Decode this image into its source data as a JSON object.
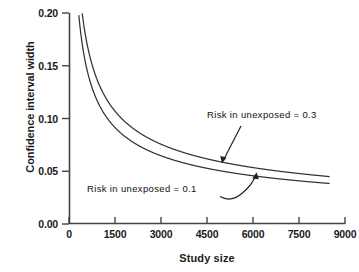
{
  "chart_data": {
    "type": "line",
    "title": "",
    "xlabel": "Study size",
    "ylabel": "Confidence interval width",
    "xlim": [
      0,
      9000
    ],
    "ylim": [
      0.0,
      0.2
    ],
    "xticks": [
      "0",
      "1500",
      "3000",
      "4500",
      "6000",
      "7500",
      "9000"
    ],
    "xtick_values": [
      0,
      1500,
      3000,
      4500,
      6000,
      7500,
      9000
    ],
    "yticks": [
      "0.00",
      "0.05",
      "0.10",
      "0.15",
      "0.20"
    ],
    "ytick_values": [
      0.0,
      0.05,
      0.1,
      0.15,
      0.2
    ],
    "grid": false,
    "legend_position": "inline-annotations",
    "x": [
      250,
      500,
      750,
      1000,
      1500,
      2000,
      2500,
      3000,
      3500,
      4000,
      4500,
      5000,
      5500,
      6000,
      6500,
      7000,
      7500,
      8000,
      8500
    ],
    "series": [
      {
        "name": "Risk in unexposed = 0.3",
        "annotation": "Risk in unexposed = 0.3",
        "values": [
          0.262,
          0.185,
          0.151,
          0.131,
          0.107,
          0.093,
          0.083,
          0.076,
          0.07,
          0.066,
          0.062,
          0.059,
          0.056,
          0.054,
          0.052,
          0.05,
          0.048,
          0.046,
          0.045
        ]
      },
      {
        "name": "Risk in unexposed = 0.1",
        "annotation": "Risk in unexposed = 0.1",
        "values": [
          0.224,
          0.158,
          0.129,
          0.112,
          0.091,
          0.079,
          0.071,
          0.065,
          0.06,
          0.056,
          0.053,
          0.05,
          0.048,
          0.046,
          0.044,
          0.042,
          0.041,
          0.039,
          0.038
        ]
      }
    ],
    "annotations": [
      {
        "text": "Risk in unexposed = 0.3",
        "points_to_series": "Risk in unexposed = 0.3",
        "arrow": "straight"
      },
      {
        "text": "Risk in unexposed = 0.1",
        "points_to_series": "Risk in unexposed = 0.1",
        "arrow": "curved"
      }
    ],
    "colors": {
      "line": "#333333",
      "text": "#111111",
      "axis": "#444444",
      "background": "#ffffff"
    }
  },
  "axes": {
    "x_title": "Study size",
    "y_title": "Confidence interval width"
  },
  "ytick_labels": [
    "0.00",
    "0.05",
    "0.10",
    "0.15",
    "0.20"
  ],
  "xtick_labels": [
    "0",
    "1500",
    "3000",
    "4500",
    "6000",
    "7500",
    "9000"
  ],
  "annotation_high": "Risk in unexposed = 0.3",
  "annotation_low": "Risk in unexposed = 0.1"
}
